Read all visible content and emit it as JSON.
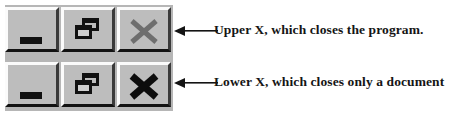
{
  "figure": {
    "background_color": "#ffffff",
    "panel": {
      "name": "window-caption-buttons",
      "face_color": "#bdbdbd",
      "panel_color": "#b6b6b6",
      "highlight_color": "#fbfbfb",
      "shadow_color": "#121212"
    },
    "rows": [
      {
        "id": "upper",
        "row_label": "Upper caption button row",
        "buttons": [
          {
            "name": "minimize-button",
            "icon": "minimize-icon",
            "tooltip": "Minimize"
          },
          {
            "name": "restore-button",
            "icon": "restore-icon",
            "tooltip": "Restore"
          },
          {
            "name": "close-button",
            "icon": "close-x-icon",
            "tooltip": "Close",
            "glyph_color": "#6e6e6e"
          }
        ],
        "annotation": "Upper X, which closes the program.",
        "arrow_direction": "left"
      },
      {
        "id": "lower",
        "row_label": "Lower caption button row",
        "buttons": [
          {
            "name": "minimize-button",
            "icon": "minimize-icon",
            "tooltip": "Minimize"
          },
          {
            "name": "restore-button",
            "icon": "restore-icon",
            "tooltip": "Restore"
          },
          {
            "name": "close-button",
            "icon": "close-x-icon",
            "tooltip": "Close",
            "glyph_color": "#0d0d0d"
          }
        ],
        "annotation": "Lower X, which closes only a document",
        "arrow_direction": "left"
      }
    ]
  }
}
